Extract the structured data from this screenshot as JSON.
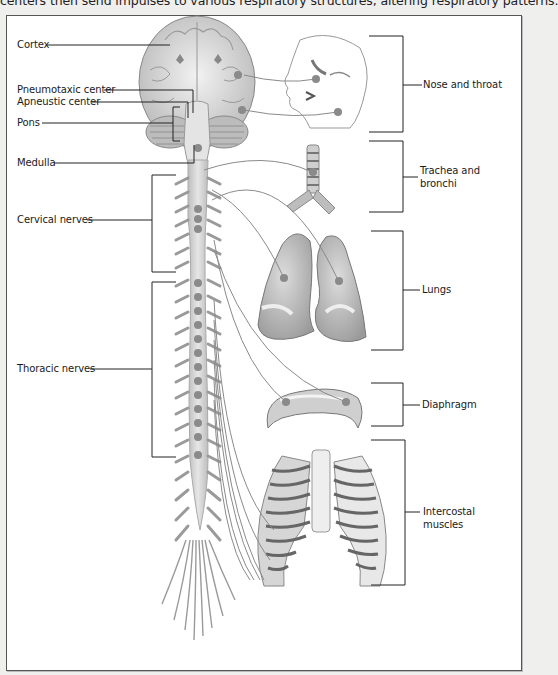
{
  "caption": "centers then send impulses to various respiratory structures, altering respiratory patterns.",
  "left_labels": {
    "cortex": "Cortex",
    "pneumotaxic": "Pneumotaxic center",
    "apneustic": "Apneustic center",
    "pons": "Pons",
    "medulla": "Medulla",
    "cervical": "Cervical nerves",
    "thoracic": "Thoracic nerves"
  },
  "right_labels": {
    "nose_throat": "Nose and throat",
    "trachea_line1": "Trachea and",
    "trachea_line2": "bronchi",
    "lungs": "Lungs",
    "diaphragm": "Diaphragm",
    "intercostal_line1": "Intercostal",
    "intercostal_line2": "muscles"
  },
  "colors": {
    "page_bg": "#efefee",
    "frame_bg": "#ffffff",
    "line": "#222222",
    "organ_fill": "#c9c9c9",
    "organ_stroke": "#777777",
    "nerve_dot": "#8a8a8a"
  }
}
